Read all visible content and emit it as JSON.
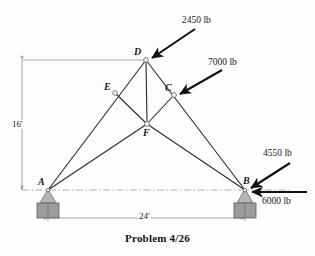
{
  "figure": {
    "caption": "Problem 4/26",
    "joints": [
      {
        "id": "A",
        "label": "A",
        "x": 48,
        "y": 190,
        "label_dx": -10,
        "label_dy": -13,
        "support": "pin"
      },
      {
        "id": "B",
        "label": "B",
        "x": 245,
        "y": 190,
        "label_dx": -2,
        "label_dy": -14,
        "support": "pin"
      },
      {
        "id": "C",
        "label": "C",
        "x": 174,
        "y": 95,
        "label_dx": -9,
        "label_dy": -12,
        "support": "none"
      },
      {
        "id": "D",
        "label": "D",
        "x": 146,
        "y": 60,
        "label_dx": -12,
        "label_dy": -13,
        "support": "none"
      },
      {
        "id": "E",
        "label": "E",
        "x": 115,
        "y": 93,
        "label_dx": -11,
        "label_dy": -11,
        "support": "none"
      },
      {
        "id": "F",
        "label": "F",
        "x": 147,
        "y": 124,
        "label_dx": -4,
        "label_dy": 4,
        "support": "none"
      }
    ],
    "members": [
      {
        "from": "A",
        "to": "D"
      },
      {
        "from": "A",
        "to": "F"
      },
      {
        "from": "D",
        "to": "B"
      },
      {
        "from": "F",
        "to": "B"
      },
      {
        "from": "D",
        "to": "F"
      },
      {
        "from": "E",
        "to": "F"
      },
      {
        "from": "C",
        "to": "F"
      }
    ],
    "loads": [
      {
        "name": "load-2450",
        "label": "2450 lb",
        "magnitude": 2450,
        "unit": "lb",
        "at_joint": "D",
        "tail_x": 195,
        "tail_y": 29,
        "head_x": 152,
        "head_y": 58,
        "label_x": 182,
        "label_y": 16
      },
      {
        "name": "load-7000",
        "label": "7000 lb",
        "magnitude": 7000,
        "unit": "lb",
        "at_joint": "C",
        "tail_x": 222,
        "tail_y": 70,
        "head_x": 180,
        "head_y": 94,
        "label_x": 208,
        "label_y": 58
      },
      {
        "name": "load-4550",
        "label": "4550 lb",
        "magnitude": 4550,
        "unit": "lb",
        "at_joint": "B",
        "tail_x": 290,
        "tail_y": 163,
        "head_x": 251,
        "head_y": 188,
        "label_x": 263,
        "label_y": 149
      },
      {
        "name": "load-6000",
        "label": "6000 lb",
        "magnitude": 6000,
        "unit": "lb",
        "at_joint": "B",
        "tail_x": 307,
        "tail_y": 192,
        "head_x": 252,
        "head_y": 192,
        "label_x": 262,
        "label_y": 197
      }
    ],
    "dimensions": [
      {
        "name": "height-dimension",
        "label": "16'",
        "value": 16,
        "unit": "ft",
        "orientation": "vertical",
        "x1": 22,
        "y1": 60,
        "x2": 22,
        "y2": 190,
        "label_x": 11,
        "label_y": 120
      },
      {
        "name": "span-dimension",
        "label": "24'",
        "value": 24,
        "unit": "ft",
        "orientation": "horizontal",
        "x1": 48,
        "y1": 218,
        "x2": 245,
        "y2": 218,
        "label_x": 138,
        "label_y": 212
      }
    ],
    "reference_lines": [
      {
        "name": "top-reference-line",
        "x1": 22,
        "y1": 60,
        "x2": 146,
        "y2": 60
      },
      {
        "name": "ground-reference-line",
        "x1": 22,
        "y1": 190,
        "x2": 290,
        "y2": 190
      }
    ],
    "colors": {
      "member": "#2b2b2b",
      "arrow": "#111111",
      "dimension": "#8a8a8a",
      "reference": "#9a9a9a",
      "support_block": "#9b9b9b",
      "support_pin": "#b5b5b5",
      "joint_fill": "#f2f2f2",
      "text": "#1a1a1a",
      "background": "#fdfdfd"
    }
  },
  "chart_data": {
    "type": "diagram",
    "title": "Problem 4/26",
    "nodes": [
      "A",
      "B",
      "C",
      "D",
      "E",
      "F"
    ],
    "edges": [
      [
        "A",
        "D"
      ],
      [
        "A",
        "F"
      ],
      [
        "D",
        "B"
      ],
      [
        "F",
        "B"
      ],
      [
        "D",
        "F"
      ],
      [
        "E",
        "F"
      ],
      [
        "C",
        "F"
      ]
    ],
    "applied_loads": [
      {
        "joint": "D",
        "magnitude": 2450,
        "unit": "lb",
        "direction": "down-left at ~34 deg"
      },
      {
        "joint": "C",
        "magnitude": 7000,
        "unit": "lb",
        "direction": "down-left at ~30 deg"
      },
      {
        "joint": "B",
        "magnitude": 4550,
        "unit": "lb",
        "direction": "down-left at ~33 deg"
      },
      {
        "joint": "B",
        "magnitude": 6000,
        "unit": "lb",
        "direction": "horizontal leftward"
      }
    ],
    "dimensions": [
      {
        "label": "16'",
        "value": 16,
        "unit": "ft",
        "measures": "vertical height from support level to apex D"
      },
      {
        "label": "24'",
        "value": 24,
        "unit": "ft",
        "measures": "horizontal span between supports A and B"
      }
    ]
  }
}
